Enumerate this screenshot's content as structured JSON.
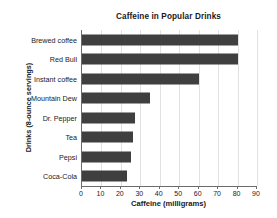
{
  "chart_data": {
    "type": "bar",
    "orientation": "horizontal",
    "title": "Caffeine in Popular Drinks",
    "xlabel": "Caffeine (milligrams)",
    "ylabel": "Drinks (8-ounce servings)",
    "categories": [
      "Brewed coffee",
      "Red Bull",
      "Instant coffee",
      "Mountain Dew",
      "Dr. Pepper",
      "Tea",
      "Pepsi",
      "Coca-Cola"
    ],
    "values": [
      80,
      80,
      60,
      35,
      27,
      26,
      25,
      23
    ],
    "xlim": [
      0,
      90
    ],
    "xticks": [
      0,
      10,
      20,
      30,
      40,
      50,
      60,
      70,
      80,
      90
    ],
    "xtick_labels": [
      "0",
      "10",
      "20",
      "30",
      "40",
      "50",
      "60",
      "70",
      "80",
      "90"
    ],
    "grid": "vertical",
    "legend": "none",
    "bar_color": "#3f3f3f",
    "gridline_color": "#e2e2e2",
    "axis_color": "#6b6b6b",
    "text_color": "#1a1a1a",
    "background": "#ffffff"
  }
}
